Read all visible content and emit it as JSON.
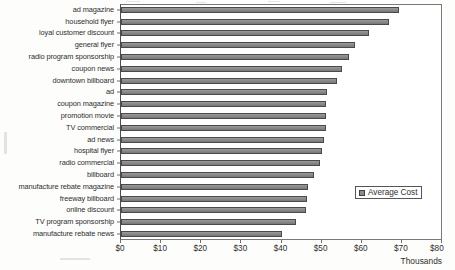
{
  "chart_data": {
    "type": "bar",
    "orientation": "horizontal",
    "title": "",
    "xlabel": "Thousands",
    "ylabel": "",
    "xlim": [
      0,
      80
    ],
    "xticks": [
      "$0",
      "$10",
      "$20",
      "$30",
      "$40",
      "$50",
      "$60",
      "$70",
      "$80"
    ],
    "xtick_values": [
      0,
      10,
      20,
      30,
      40,
      50,
      60,
      70,
      80
    ],
    "grid": false,
    "legend": {
      "position": "center-right",
      "entries": [
        {
          "name": "Average Cost",
          "color": "#8a8a8a"
        }
      ]
    },
    "series": [
      {
        "name": "Average Cost",
        "color": "#8a8a8a",
        "values": [
          69.2,
          66.8,
          61.8,
          58.3,
          56.7,
          55.2,
          53.9,
          51.3,
          51.1,
          51.0,
          51.0,
          50.5,
          50.1,
          49.7,
          48.2,
          46.6,
          46.4,
          46.1,
          43.7,
          40.2
        ]
      }
    ],
    "categories": [
      "ad magazine",
      "household flyer",
      "loyal customer discount",
      "general flyer",
      "radio program sponsorship",
      "coupon news",
      "downtown billboard",
      "ad",
      "coupon magazine",
      "promotion movie",
      "TV commercial",
      "ad news",
      "hospital flyer",
      "radio commercial",
      "billboard",
      "manufacture rebate magazine",
      "freeway billboard",
      "online discount",
      "TV program sponsorship",
      "manufacture rebate news"
    ]
  }
}
